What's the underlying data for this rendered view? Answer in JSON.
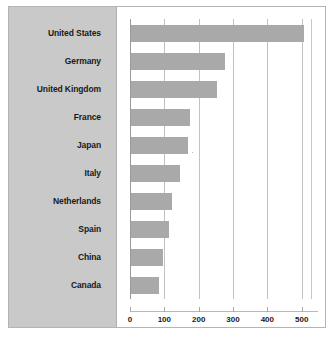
{
  "chart_data": {
    "type": "bar",
    "orientation": "horizontal",
    "title": "",
    "subtitle": "",
    "xlabel": "",
    "ylabel": "",
    "categories": [
      "United States",
      "Germany",
      "United Kingdom",
      "France",
      "Japan",
      "Italy",
      "Netherlands",
      "Spain",
      "China",
      "Canada"
    ],
    "values": [
      505,
      275,
      250,
      172,
      167,
      142,
      118,
      110,
      92,
      82
    ],
    "xlim": [
      0,
      530
    ],
    "xticks": [
      0,
      100,
      200,
      300,
      400,
      500
    ],
    "xtick_labels": [
      "0",
      "100",
      "200",
      "300",
      "400",
      "500"
    ],
    "grid": "vertical",
    "legend": "none",
    "bar_color": "#a9a9a9",
    "label_panel_color": "#c9c9c9",
    "gridline_color": "#c2c2c2",
    "axis_color": "#9a9a9a",
    "text_color": "#1a1a1a",
    "background": "#ffffff"
  }
}
